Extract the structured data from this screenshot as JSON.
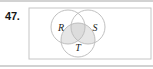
{
  "exercise": {
    "number_label": "47.",
    "figure_name": "venn-diagram-three-sets"
  },
  "figure": {
    "universe_label": "",
    "sets": [
      {
        "id": "R",
        "label": "R",
        "cx": 40,
        "cy": 21,
        "r": 17,
        "label_x": 33,
        "label_y": 25
      },
      {
        "id": "S",
        "label": "S",
        "cx": 60,
        "cy": 21,
        "r": 17,
        "label_x": 66,
        "label_y": 25
      },
      {
        "id": "T",
        "label": "T",
        "cx": 50,
        "cy": 34,
        "r": 17,
        "label_x": 48,
        "label_y": 44
      }
    ],
    "shaded_regions": [
      "R-and-S-and-T",
      "R-and-T",
      "S-and-T"
    ],
    "rect": {
      "x": 1,
      "y": 2,
      "width": 122,
      "height": 51
    }
  },
  "colors": {
    "stroke": "#b9b9b9",
    "rect_stroke": "#c6c6c6",
    "shade_fill": "#e2e2e2",
    "label_text": "#1b1b1b",
    "number_text": "#161616",
    "band": "#d2d2d2",
    "background": "#ffffff"
  }
}
